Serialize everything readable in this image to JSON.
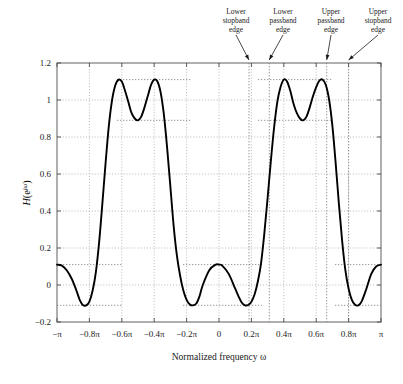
{
  "figure": {
    "caption": ""
  },
  "axes": {
    "xlabel": "Normalized frequency ω",
    "ylabel_H": "H",
    "ylabel_arg": "(e",
    "ylabel_exp": "jω",
    "ylabel_close": ")",
    "xticklabels": [
      "−π",
      "−0.8π",
      "−0.6π",
      "−0.4π",
      "−0.2π",
      "0",
      "0.2π",
      "0.4π",
      "0.6π",
      "0.8π",
      "π"
    ],
    "yticklabels": [
      "−0.2",
      "0",
      "0.2",
      "0.4",
      "0.6",
      "0.8",
      "1",
      "1.2"
    ]
  },
  "annotations": [
    {
      "id": "lower-stopband-edge",
      "line1": "Lower",
      "line2": "stopband",
      "line3": "edge",
      "omega": 0.185
    },
    {
      "id": "lower-passband-edge",
      "line1": "Lower",
      "line2": "passband",
      "line3": "edge",
      "omega": 0.31
    },
    {
      "id": "upper-passband-edge",
      "line1": "Upper",
      "line2": "passband",
      "line3": "edge",
      "omega": 0.665
    },
    {
      "id": "upper-stopband-edge",
      "line1": "Upper",
      "line2": "stopband",
      "line3": "edge",
      "omega": 0.8
    }
  ],
  "colors": {
    "curve": "#000000",
    "frame": "#6e6e6e",
    "grid": "#9a9a9a",
    "marker_line": "#8a8a8a",
    "ripple_line": "#7a7a7a",
    "text": "#1a1a1a",
    "background": "#ffffff"
  },
  "chart_data": {
    "type": "line",
    "title": "",
    "xlabel": "Normalized frequency ω",
    "ylabel": "H(e^{jω})",
    "xlim": [
      -1.0,
      1.0
    ],
    "ylim": [
      -0.2,
      1.2
    ],
    "x_unit": "pi radians/sample",
    "xticks": [
      -1.0,
      -0.8,
      -0.6,
      -0.4,
      -0.2,
      0,
      0.2,
      0.4,
      0.6,
      0.8,
      1.0
    ],
    "yticks": [
      -0.2,
      0,
      0.2,
      0.4,
      0.6,
      0.8,
      1.0,
      1.2
    ],
    "grid": true,
    "legend": null,
    "filter_type": "bandstop (multiband equiripple FIR)",
    "band_edges": {
      "lower_stopband_edge": 0.185,
      "lower_passband_edge": 0.31,
      "upper_passband_edge": 0.665,
      "upper_stopband_edge": 0.8
    },
    "ripple": {
      "passband_max": 1.11,
      "passband_min": 0.89,
      "stopband_max": 0.11,
      "stopband_min": -0.11,
      "delta": 0.11
    },
    "series": [
      {
        "name": "H(e^{jω})",
        "x": [
          -1.0,
          -0.97,
          -0.94,
          -0.91,
          -0.88,
          -0.86,
          -0.84,
          -0.82,
          -0.8,
          -0.78,
          -0.76,
          -0.74,
          -0.72,
          -0.7,
          -0.68,
          -0.66,
          -0.64,
          -0.62,
          -0.6,
          -0.58,
          -0.56,
          -0.54,
          -0.52,
          -0.5,
          -0.48,
          -0.46,
          -0.44,
          -0.42,
          -0.4,
          -0.38,
          -0.36,
          -0.34,
          -0.32,
          -0.3,
          -0.28,
          -0.26,
          -0.24,
          -0.22,
          -0.2,
          -0.18,
          -0.16,
          -0.14,
          -0.12,
          -0.1,
          -0.06,
          -0.02,
          0.0,
          0.02,
          0.06,
          0.1,
          0.12,
          0.14,
          0.16,
          0.18,
          0.2,
          0.22,
          0.24,
          0.26,
          0.28,
          0.3,
          0.32,
          0.34,
          0.36,
          0.38,
          0.4,
          0.42,
          0.44,
          0.46,
          0.48,
          0.5,
          0.52,
          0.54,
          0.56,
          0.58,
          0.6,
          0.62,
          0.64,
          0.66,
          0.68,
          0.7,
          0.72,
          0.74,
          0.76,
          0.78,
          0.8,
          0.82,
          0.84,
          0.86,
          0.88,
          0.91,
          0.94,
          0.97,
          1.0
        ],
        "y": [
          0.11,
          0.105,
          0.08,
          0.035,
          -0.03,
          -0.08,
          -0.108,
          -0.11,
          -0.09,
          -0.03,
          0.07,
          0.23,
          0.44,
          0.66,
          0.86,
          1.0,
          1.08,
          1.11,
          1.1,
          1.05,
          0.99,
          0.93,
          0.9,
          0.89,
          0.91,
          0.96,
          1.02,
          1.08,
          1.11,
          1.1,
          1.04,
          0.92,
          0.74,
          0.53,
          0.32,
          0.16,
          0.05,
          -0.03,
          -0.08,
          -0.105,
          -0.11,
          -0.1,
          -0.06,
          0.0,
          0.08,
          0.11,
          0.11,
          0.105,
          0.06,
          -0.02,
          -0.06,
          -0.095,
          -0.11,
          -0.108,
          -0.09,
          -0.05,
          0.02,
          0.12,
          0.28,
          0.47,
          0.67,
          0.85,
          0.99,
          1.07,
          1.11,
          1.1,
          1.05,
          0.98,
          0.93,
          0.9,
          0.89,
          0.91,
          0.96,
          1.02,
          1.07,
          1.105,
          1.11,
          1.08,
          1.0,
          0.86,
          0.66,
          0.44,
          0.24,
          0.08,
          -0.02,
          -0.08,
          -0.107,
          -0.11,
          -0.09,
          -0.02,
          0.06,
          0.1,
          0.11
        ]
      }
    ]
  }
}
